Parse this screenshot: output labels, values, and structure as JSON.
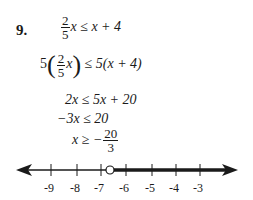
{
  "problem": {
    "number": "9.",
    "steps": [
      {
        "lhs_coef_num": "2",
        "lhs_coef_den": "5",
        "lhs_var": "x",
        "rel": " ≤ ",
        "rhs": "x + 4"
      },
      {
        "mult": "5",
        "frac_num": "2",
        "frac_den": "5",
        "var": "x",
        "rel": " ≤ ",
        "rhs": "5(x + 4)"
      },
      {
        "text": "2x ≤ 5x + 20"
      },
      {
        "text": "−3x ≤ 20"
      },
      {
        "lhs": "x ≥ −",
        "frac_num": "20",
        "frac_den": "3"
      }
    ]
  },
  "number_line": {
    "ticks": [
      "-9",
      "-8",
      "-7",
      "-6",
      "-5",
      "-4",
      "-3"
    ],
    "point_label": "-20/3",
    "point_type": "open-circle",
    "shaded_direction": "right",
    "line_color": "#1a1a1a"
  }
}
